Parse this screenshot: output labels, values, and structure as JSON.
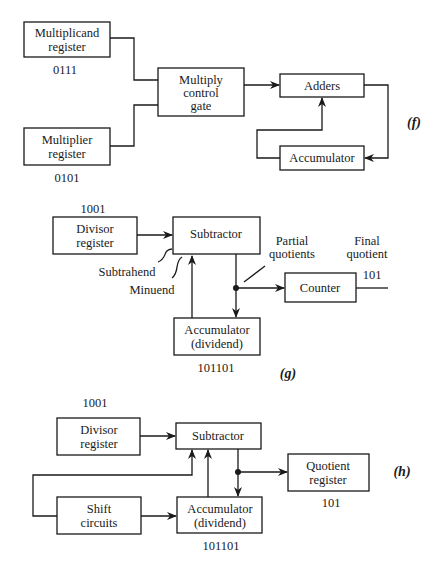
{
  "diagram_f": {
    "caption": "(f)",
    "multiplicand": {
      "line1": "Multiplicand",
      "line2": "register",
      "value": "0111"
    },
    "multiplier": {
      "line1": "Multiplier",
      "line2": "register",
      "value": "0101"
    },
    "gate": {
      "line1": "Multiply",
      "line2": "control",
      "line3": "gate"
    },
    "adders": {
      "label": "Adders"
    },
    "accumulator": {
      "label": "Accumulator"
    }
  },
  "diagram_g": {
    "caption": "(g)",
    "divisor": {
      "line1": "Divisor",
      "line2": "register",
      "value": "1001"
    },
    "subtractor": {
      "label": "Subtractor"
    },
    "subtrahend_label": "Subtrahend",
    "minuend_label": "Minuend",
    "partial_label": {
      "line1": "Partial",
      "line2": "quotients"
    },
    "final_label": {
      "line1": "Final",
      "line2": "quotient",
      "value": "101"
    },
    "counter": {
      "label": "Counter"
    },
    "accumulator": {
      "line1": "Accumulator",
      "line2": "(dividend)",
      "value": "101101"
    }
  },
  "diagram_h": {
    "caption": "(h)",
    "divisor": {
      "line1": "Divisor",
      "line2": "register",
      "value": "1001"
    },
    "subtractor": {
      "label": "Subtractor"
    },
    "quotient": {
      "line1": "Quotient",
      "line2": "register",
      "value": "101"
    },
    "shift": {
      "line1": "Shift",
      "line2": "circuits"
    },
    "accumulator": {
      "line1": "Accumulator",
      "line2": "(dividend)",
      "value": "101101"
    }
  }
}
